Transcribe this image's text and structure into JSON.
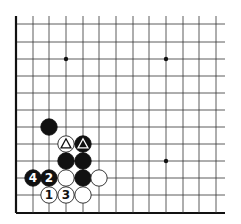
{
  "diagram": {
    "type": "go-board-diagram",
    "grid": {
      "columns_x": [
        16,
        33,
        49,
        66,
        83,
        99,
        116,
        133,
        149,
        166,
        183,
        199,
        216
      ],
      "rows_y": [
        24,
        42,
        59,
        76,
        93,
        110,
        127,
        144,
        161,
        178,
        195,
        213
      ],
      "line_extend_right": 225,
      "line_extend_top": 16,
      "edges": [
        "left",
        "bottom"
      ],
      "line_color": "#333333",
      "edge_color": "#111111"
    },
    "star_points": [
      {
        "col": 3,
        "row": 2
      },
      {
        "col": 9,
        "row": 2
      },
      {
        "col": 9,
        "row": 8
      }
    ],
    "stones": [
      {
        "color": "black",
        "col": 2,
        "row": 6,
        "label": ""
      },
      {
        "color": "white",
        "col": 3,
        "row": 7,
        "label": "",
        "mark": "triangle"
      },
      {
        "color": "black",
        "col": 4,
        "row": 7,
        "label": "",
        "mark": "triangle"
      },
      {
        "color": "black",
        "col": 3,
        "row": 8,
        "label": ""
      },
      {
        "color": "black",
        "col": 4,
        "row": 8,
        "label": ""
      },
      {
        "color": "black",
        "col": 1,
        "row": 9,
        "label": "4"
      },
      {
        "color": "black",
        "col": 2,
        "row": 9,
        "label": "2"
      },
      {
        "color": "white",
        "col": 3,
        "row": 9,
        "label": ""
      },
      {
        "color": "black",
        "col": 4,
        "row": 9,
        "label": ""
      },
      {
        "color": "white",
        "col": 5,
        "row": 9,
        "label": ""
      },
      {
        "color": "white",
        "col": 2,
        "row": 10,
        "label": "1"
      },
      {
        "color": "white",
        "col": 3,
        "row": 10,
        "label": "3"
      },
      {
        "color": "white",
        "col": 4,
        "row": 10,
        "label": ""
      }
    ],
    "colors": {
      "black_stone": "#111111",
      "white_stone": "#ffffff",
      "white_stroke": "#222222",
      "background": "#ffffff"
    }
  }
}
